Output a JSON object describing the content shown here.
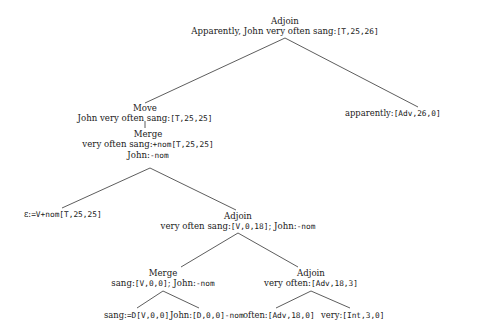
{
  "tree": {
    "root": {
      "op": "Adjoin",
      "label": "Apparently, John very often sang:",
      "feat": "[T,25,26]"
    },
    "apparently_leaf": {
      "label": "apparently:",
      "feat": "[Adv,26,0]"
    },
    "move": {
      "op": "Move",
      "label": "John very often sang:",
      "feat": "[T,25,25]"
    },
    "merge_top": {
      "op": "Merge",
      "label": "very often sang:",
      "feat": "+nom[T,25,25]",
      "mover": "John:",
      "mover_feat": "-nom"
    },
    "epsilon_leaf": {
      "label": "ε:",
      "feat": "=V+nom[T,25,25]"
    },
    "adjoin_mid": {
      "op": "Adjoin",
      "label": "very often sang:",
      "feat": "[V,0,18]",
      "sep": "; John:",
      "mover_feat": "-nom"
    },
    "merge_low": {
      "op": "Merge",
      "label": "sang:",
      "feat": "[V,0,0]",
      "sep": "; John:",
      "mover_feat": "-nom"
    },
    "adjoin_low": {
      "op": "Adjoin",
      "label": "very often:",
      "feat": "[Adv,18,3]"
    },
    "leaves_bottom": [
      {
        "label": "sang:",
        "feat": "=D[V,0,0]"
      },
      {
        "label": "John:",
        "feat": "[D,0,0]-nom"
      },
      {
        "label": "often:",
        "feat": "[Adv,18,0]"
      },
      {
        "label": "very:",
        "feat": "[Int,3,0]"
      }
    ]
  }
}
